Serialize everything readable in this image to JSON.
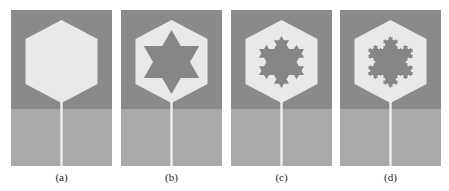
{
  "figure": {
    "colors": {
      "background": "#ffffff",
      "upper_substrate": "#8a8a8a",
      "ground_plane": "#a9a9a9",
      "patch": "#e9e9e9",
      "slot": "#868686",
      "feed_line": "#efefef",
      "caption": "#222222"
    },
    "panels": [
      {
        "id": "a",
        "label": "(a)",
        "left": 11,
        "iteration": -1
      },
      {
        "id": "b",
        "label": "(b)",
        "left": 121,
        "iteration": 0
      },
      {
        "id": "c",
        "label": "(c)",
        "left": 231,
        "iteration": 1
      },
      {
        "id": "d",
        "label": "(d)",
        "left": 340,
        "iteration": 2
      }
    ]
  }
}
